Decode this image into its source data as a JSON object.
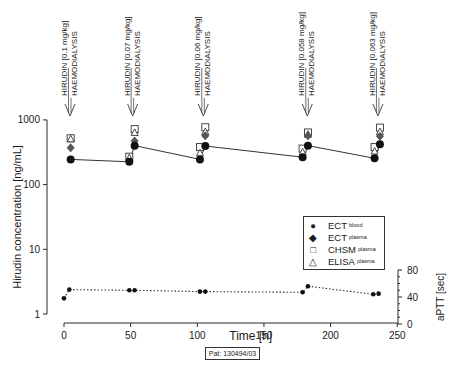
{
  "chart_data": {
    "type": "scatter",
    "title": "",
    "xlabel": "Time [h]",
    "ylabel": "Hirudin concentration [ng/mL]",
    "y2label": "aPTT [sec]",
    "xlim": [
      0,
      250
    ],
    "ylim": [
      1,
      1000
    ],
    "yscale": "log",
    "y2lim": [
      0,
      80
    ],
    "xticks": [
      0,
      50,
      100,
      150,
      200,
      250
    ],
    "yticks": [
      1,
      10,
      100,
      1000
    ],
    "y2ticks": [
      0,
      40,
      80
    ],
    "grid": false,
    "legend_position": "lower right (inside)",
    "annotations": [
      {
        "x": 3,
        "drug": "HIRUDIN [0.1 mg/kg]",
        "event": "HAEMODIALYSIS"
      },
      {
        "x": 50,
        "drug": "HIRUDIN [0.07 mg/kg]",
        "event": "HAEMODIALYSIS"
      },
      {
        "x": 103,
        "drug": "HIRUDIN [0.06 mg/kg]",
        "event": "HAEMODIALYSIS"
      },
      {
        "x": 181,
        "drug": "HIRUDIN [0.058 mg/kg]",
        "event": "HAEMODIALYSIS"
      },
      {
        "x": 234,
        "drug": "HIRUDIN [0.063 mg/kg]",
        "event": "HAEMODIALYSIS"
      }
    ],
    "series": [
      {
        "name": "ECT blood",
        "marker": "filled-circle",
        "line": "solid",
        "points": [
          [
            5,
            245
          ],
          [
            49,
            225
          ],
          [
            53,
            400
          ],
          [
            102,
            245
          ],
          [
            106,
            395
          ],
          [
            179,
            265
          ],
          [
            183,
            400
          ],
          [
            233,
            255
          ],
          [
            237,
            420
          ]
        ]
      },
      {
        "name": "ECT plasma",
        "marker": "filled-diamond",
        "line": "none",
        "points": [
          [
            5,
            370
          ],
          [
            53,
            470
          ],
          [
            106,
            570
          ],
          [
            183,
            570
          ],
          [
            237,
            560
          ]
        ]
      },
      {
        "name": "CHSM plasma",
        "marker": "open-square",
        "line": "none",
        "points": [
          [
            5,
            520
          ],
          [
            49,
            270
          ],
          [
            53,
            720
          ],
          [
            102,
            380
          ],
          [
            106,
            770
          ],
          [
            179,
            360
          ],
          [
            183,
            640
          ],
          [
            233,
            380
          ],
          [
            237,
            760
          ]
        ]
      },
      {
        "name": "ELISA plasma",
        "marker": "open-triangle",
        "line": "none",
        "points": [
          [
            5,
            510
          ],
          [
            49,
            260
          ],
          [
            53,
            640
          ],
          [
            102,
            310
          ],
          [
            106,
            660
          ],
          [
            179,
            320
          ],
          [
            183,
            600
          ],
          [
            233,
            330
          ],
          [
            237,
            660
          ]
        ]
      },
      {
        "name": "aPTT",
        "axis": "right",
        "marker": "small-filled-circle",
        "line": "dotted",
        "points": [
          [
            0,
            38
          ],
          [
            4,
            51
          ],
          [
            49,
            50
          ],
          [
            53,
            50
          ],
          [
            102,
            48
          ],
          [
            106,
            48
          ],
          [
            179,
            47
          ],
          [
            183,
            56
          ],
          [
            232,
            44
          ],
          [
            236,
            45
          ]
        ]
      }
    ]
  },
  "legend": {
    "items": [
      {
        "symbol": "●",
        "label": "ECT",
        "sub": "blood"
      },
      {
        "symbol": "◆",
        "label": "ECT",
        "sub": "plasma"
      },
      {
        "symbol": "□",
        "label": "CHSM",
        "sub": "plasma"
      },
      {
        "symbol": "△",
        "label": "ELISA",
        "sub": "plasma"
      }
    ]
  },
  "footer": {
    "patient_label": "Pat: 130494/03"
  }
}
